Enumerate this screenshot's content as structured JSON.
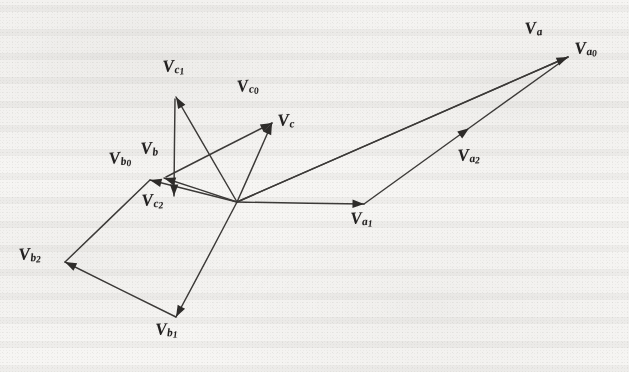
{
  "figure": {
    "kind": "vector-diagram",
    "origin_label": "",
    "background_color": "#f6f5f3",
    "ink_color": "#3c3a38"
  },
  "chart_data": {
    "type": "scatter",
    "xlabel": "",
    "ylabel": "",
    "xlim": [
      0,
      629
    ],
    "ylim": [
      372,
      0
    ],
    "grid": false,
    "legend": "none",
    "origin": {
      "x": 237,
      "y": 202
    },
    "vectors": [
      {
        "name": "V_a0",
        "label": "V",
        "sub": "a",
        "idx": "0",
        "from": {
          "x": 237,
          "y": 202
        },
        "to": {
          "x": 568,
          "y": 57
        },
        "arrow": "tip"
      },
      {
        "name": "V_a",
        "label": "V",
        "sub": "a",
        "idx": "",
        "from": {
          "x": 237,
          "y": 202
        },
        "to": {
          "x": 568,
          "y": 57
        },
        "arrow": "none"
      },
      {
        "name": "V_a1",
        "label": "V",
        "sub": "a",
        "idx": "1",
        "from": {
          "x": 237,
          "y": 202
        },
        "to": {
          "x": 364,
          "y": 204
        },
        "arrow": "tip"
      },
      {
        "name": "V_a2",
        "label": "V",
        "sub": "a",
        "idx": "2",
        "from": {
          "x": 364,
          "y": 204
        },
        "to": {
          "x": 568,
          "y": 57
        },
        "arrow": "mid"
      },
      {
        "name": "V_b0",
        "label": "V",
        "sub": "b",
        "idx": "0",
        "from": {
          "x": 237,
          "y": 202
        },
        "to": {
          "x": 150,
          "y": 180
        },
        "arrow": "tip"
      },
      {
        "name": "V_b",
        "label": "V",
        "sub": "b",
        "idx": "",
        "from": {
          "x": 237,
          "y": 202
        },
        "to": {
          "x": 164,
          "y": 178
        },
        "arrow": "tip"
      },
      {
        "name": "V_b1",
        "label": "V",
        "sub": "b",
        "idx": "1",
        "from": {
          "x": 237,
          "y": 202
        },
        "to": {
          "x": 176,
          "y": 317
        },
        "arrow": "tip"
      },
      {
        "name": "V_b2",
        "label": "V",
        "sub": "b",
        "idx": "2",
        "from": {
          "x": 176,
          "y": 317
        },
        "to": {
          "x": 65,
          "y": 262
        },
        "arrow": "tip"
      },
      {
        "name": "V_b0_leg",
        "label": "",
        "sub": "",
        "idx": "",
        "from": {
          "x": 65,
          "y": 262
        },
        "to": {
          "x": 150,
          "y": 180
        },
        "arrow": "none"
      },
      {
        "name": "V_c0",
        "label": "V",
        "sub": "c",
        "idx": "0",
        "from": {
          "x": 237,
          "y": 202
        },
        "to": {
          "x": 272,
          "y": 123
        },
        "arrow": "tip"
      },
      {
        "name": "V_c",
        "label": "V",
        "sub": "c",
        "idx": "",
        "from": {
          "x": 166,
          "y": 177
        },
        "to": {
          "x": 272,
          "y": 123
        },
        "arrow": "tip"
      },
      {
        "name": "V_c1",
        "label": "V",
        "sub": "c",
        "idx": "1",
        "from": {
          "x": 237,
          "y": 202
        },
        "to": {
          "x": 176,
          "y": 97
        },
        "arrow": "tip"
      },
      {
        "name": "V_c2",
        "label": "V",
        "sub": "c",
        "idx": "2",
        "from": {
          "x": 175,
          "y": 99
        },
        "to": {
          "x": 174,
          "y": 196
        },
        "arrow": "tip"
      }
    ],
    "labels": [
      {
        "name": "label-vc1",
        "text": "V",
        "sub": "c",
        "idx": "1",
        "x": 162,
        "y": 58,
        "rot": -4
      },
      {
        "name": "label-vc0",
        "text": "V",
        "sub": "c",
        "idx": "0",
        "x": 236,
        "y": 78,
        "rot": -6
      },
      {
        "name": "label-vc",
        "text": "V",
        "sub": "c",
        "idx": "",
        "x": 277,
        "y": 112,
        "rot": -4
      },
      {
        "name": "label-vb",
        "text": "V",
        "sub": "b",
        "idx": "",
        "x": 140,
        "y": 140,
        "rot": -4
      },
      {
        "name": "label-vb0",
        "text": "V",
        "sub": "b",
        "idx": "0",
        "x": 108,
        "y": 150,
        "rot": -5
      },
      {
        "name": "label-vc2",
        "text": "V",
        "sub": "c",
        "idx": "2",
        "x": 141,
        "y": 192,
        "rot": -4
      },
      {
        "name": "label-vb2",
        "text": "V",
        "sub": "b",
        "idx": "2",
        "x": 18,
        "y": 246,
        "rot": -4
      },
      {
        "name": "label-vb1",
        "text": "V",
        "sub": "b",
        "idx": "1",
        "x": 155,
        "y": 321,
        "rot": -3
      },
      {
        "name": "label-va1",
        "text": "V",
        "sub": "a",
        "idx": "1",
        "x": 350,
        "y": 210,
        "rot": -3
      },
      {
        "name": "label-va2",
        "text": "V",
        "sub": "a",
        "idx": "2",
        "x": 457,
        "y": 147,
        "rot": -4
      },
      {
        "name": "label-va",
        "text": "V",
        "sub": "a",
        "idx": "",
        "x": 524,
        "y": 20,
        "rot": -5
      },
      {
        "name": "label-va0",
        "text": "V",
        "sub": "a",
        "idx": "0",
        "x": 574,
        "y": 40,
        "rot": -4
      }
    ]
  }
}
